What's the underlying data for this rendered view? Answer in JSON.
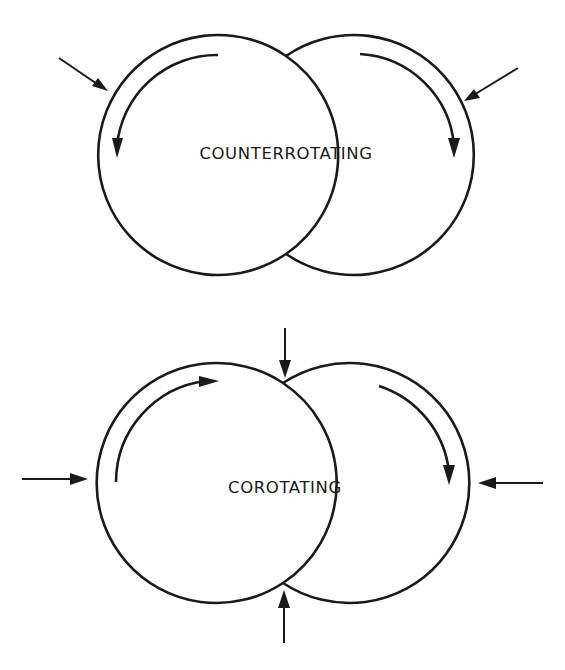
{
  "diagram": {
    "panels": [
      {
        "id": "counterrotating",
        "label": "COUNTERROTATING",
        "description": "Two overlapping circular lobes; internal flow arrows rotate in opposite directions (left lobe counterclockwise, right lobe clockwise); two external arrows push in from upper-left and upper-right"
      },
      {
        "id": "corotating",
        "label": "COROTATING",
        "description": "Two overlapping circular lobes; internal flow arrows rotate in the same (clockwise) direction; four external arrows push in from left, right, top and bottom"
      }
    ],
    "colors": {
      "line": "#1a1a1a",
      "background": "#ffffff"
    }
  }
}
